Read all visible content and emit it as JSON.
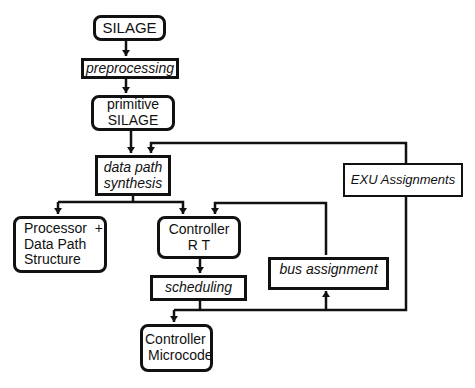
{
  "diagram": {
    "type": "flowchart",
    "nodes": [
      {
        "id": "silage",
        "lines": [
          "SILAGE"
        ],
        "shape": "rounded",
        "style": "normal"
      },
      {
        "id": "preprocessing",
        "lines": [
          "preprocessing"
        ],
        "shape": "rect",
        "style": "italic"
      },
      {
        "id": "primitive_silage",
        "lines": [
          "primitive",
          "SILAGE"
        ],
        "shape": "rounded",
        "style": "normal"
      },
      {
        "id": "data_path_synthesis",
        "lines": [
          "data path",
          "synthesis"
        ],
        "shape": "rect",
        "style": "italic"
      },
      {
        "id": "processor",
        "lines": [
          "Processor  +",
          "Data Path",
          "Structure"
        ],
        "shape": "rounded",
        "style": "normal"
      },
      {
        "id": "controller_rt",
        "lines": [
          "Controller",
          "R T"
        ],
        "shape": "rounded",
        "style": "normal"
      },
      {
        "id": "scheduling",
        "lines": [
          "scheduling"
        ],
        "shape": "rect",
        "style": "italic"
      },
      {
        "id": "bus_assignment",
        "lines": [
          "bus assignment"
        ],
        "shape": "rect",
        "style": "italic"
      },
      {
        "id": "exu_assignments",
        "lines": [
          "EXU Assignments"
        ],
        "shape": "rect",
        "style": "italic"
      },
      {
        "id": "controller_microcode",
        "lines": [
          "Controller",
          "Microcode"
        ],
        "shape": "rounded",
        "style": "normal"
      }
    ],
    "edges": [
      {
        "from": "silage",
        "to": "preprocessing"
      },
      {
        "from": "preprocessing",
        "to": "primitive_silage"
      },
      {
        "from": "primitive_silage",
        "to": "data_path_synthesis"
      },
      {
        "from": "exu_assignments",
        "to": "data_path_synthesis"
      },
      {
        "from": "data_path_synthesis",
        "to": "processor"
      },
      {
        "from": "data_path_synthesis",
        "to": "controller_rt"
      },
      {
        "from": "bus_assignment",
        "to": "controller_rt"
      },
      {
        "from": "controller_rt",
        "to": "scheduling"
      },
      {
        "from": "scheduling",
        "to": "controller_microcode"
      },
      {
        "from": "scheduling",
        "to": "bus_assignment"
      },
      {
        "from": "scheduling",
        "to": "exu_assignments"
      }
    ]
  }
}
